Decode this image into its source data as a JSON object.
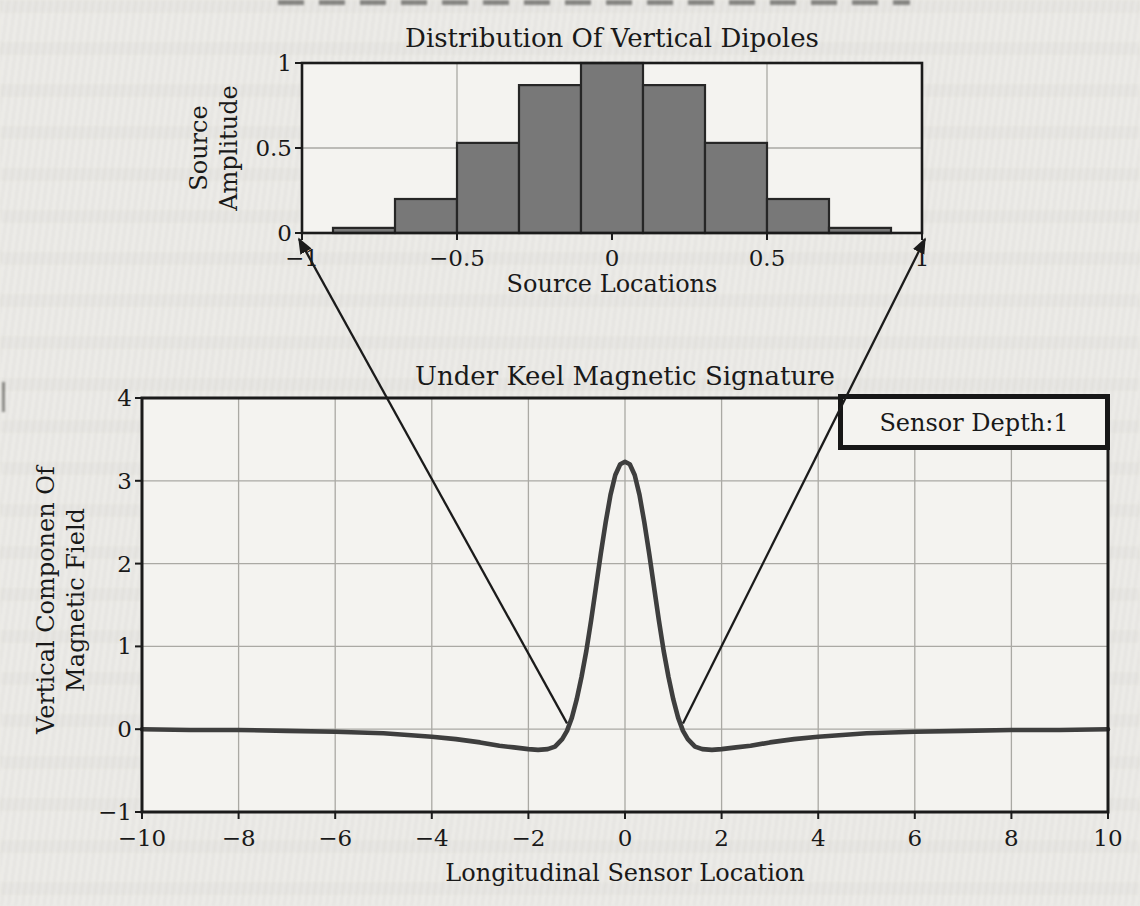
{
  "page": {
    "paper_color": "#ecebe7",
    "plot_color": "#f4f3f0",
    "ink_color": "#1b1b1b",
    "grid_color": "#aaa9a4",
    "bar_fill": "#787878",
    "bar_stroke": "#262626",
    "curve_color": "#3e3e3e"
  },
  "chart_data": [
    {
      "id": "dipole-distribution",
      "type": "bar",
      "title": "Distribution Of Vertical Dipoles",
      "xlabel": "Source Locations",
      "ylabel_lines": [
        "Source",
        "Amplitude"
      ],
      "xlim": [
        -1,
        1
      ],
      "ylim": [
        0,
        1
      ],
      "xticks": [
        -1,
        -0.5,
        0,
        0.5,
        1
      ],
      "xtick_labels": [
        "−1",
        "−0.5",
        "0",
        "0.5",
        "1"
      ],
      "yticks": [
        0,
        0.5,
        1
      ],
      "ytick_labels": [
        "0",
        "0.5",
        "1"
      ],
      "grid_x": [
        -0.5,
        0,
        0.5
      ],
      "grid_y": [
        0.5
      ],
      "grid": true,
      "bar_width": 0.2,
      "categories": [
        -0.8,
        -0.6,
        -0.4,
        -0.2,
        0,
        0.2,
        0.4,
        0.6,
        0.8
      ],
      "values": [
        0.03,
        0.2,
        0.53,
        0.87,
        1.0,
        0.87,
        0.53,
        0.2,
        0.03
      ]
    },
    {
      "id": "underkeel-signature",
      "type": "line",
      "title": "Under Keel Magnetic Signature",
      "xlabel": "Longitudinal Sensor Location",
      "ylabel_lines": [
        "Vertical Componen Of",
        "Magnetic Field"
      ],
      "xlim": [
        -10,
        10
      ],
      "ylim": [
        -1,
        4
      ],
      "xticks": [
        -10,
        -8,
        -6,
        -4,
        -2,
        0,
        2,
        4,
        6,
        8,
        10
      ],
      "xtick_labels": [
        "−10",
        "−8",
        "−6",
        "−4",
        "−2",
        "0",
        "2",
        "4",
        "6",
        "8",
        "10"
      ],
      "yticks": [
        -1,
        0,
        1,
        2,
        3,
        4
      ],
      "ytick_labels": [
        "−1",
        "0",
        "1",
        "2",
        "3",
        "4"
      ],
      "grid_x": [
        -8,
        -6,
        -4,
        -2,
        0,
        2,
        4,
        6,
        8
      ],
      "grid_y": [
        0,
        1,
        2,
        3
      ],
      "grid": true,
      "legend": {
        "label": "Sensor Depth:1",
        "position": "top-right"
      },
      "series": [
        {
          "name": "Sensor Depth:1",
          "x": [
            -10,
            -9,
            -8,
            -7,
            -6,
            -5,
            -4.5,
            -4,
            -3.5,
            -3,
            -2.6,
            -2.3,
            -2,
            -1.8,
            -1.6,
            -1.45,
            -1.3,
            -1.2,
            -1.1,
            -1,
            -0.9,
            -0.8,
            -0.7,
            -0.6,
            -0.5,
            -0.4,
            -0.3,
            -0.2,
            -0.1,
            0,
            0.1,
            0.2,
            0.3,
            0.4,
            0.5,
            0.6,
            0.7,
            0.8,
            0.9,
            1,
            1.1,
            1.2,
            1.3,
            1.45,
            1.6,
            1.8,
            2,
            2.3,
            2.6,
            3,
            3.5,
            4,
            4.5,
            5,
            6,
            7,
            8,
            9,
            10
          ],
          "y": [
            0,
            -0.01,
            -0.01,
            -0.02,
            -0.03,
            -0.05,
            -0.07,
            -0.09,
            -0.12,
            -0.16,
            -0.2,
            -0.22,
            -0.24,
            -0.25,
            -0.24,
            -0.21,
            -0.12,
            -0.02,
            0.14,
            0.36,
            0.63,
            0.95,
            1.32,
            1.72,
            2.12,
            2.5,
            2.83,
            3.07,
            3.2,
            3.23,
            3.2,
            3.07,
            2.83,
            2.5,
            2.12,
            1.72,
            1.32,
            0.95,
            0.63,
            0.36,
            0.14,
            -0.02,
            -0.12,
            -0.21,
            -0.24,
            -0.25,
            -0.24,
            -0.22,
            -0.2,
            -0.16,
            -0.12,
            -0.09,
            -0.07,
            -0.05,
            -0.03,
            -0.02,
            -0.01,
            -0.01,
            0
          ]
        }
      ]
    }
  ],
  "annotations": {
    "arrows": [
      {
        "name": "zoom-link-left",
        "from_chart": "underkeel-signature",
        "from": {
          "x": -1.2,
          "y": 0.07
        },
        "to_chart": "dipole-distribution",
        "to": {
          "x": -1,
          "y": 0
        }
      },
      {
        "name": "zoom-link-right",
        "from_chart": "underkeel-signature",
        "from": {
          "x": 1.2,
          "y": 0.07
        },
        "to_chart": "dipole-distribution",
        "to": {
          "x": 1,
          "y": 0
        }
      }
    ]
  }
}
